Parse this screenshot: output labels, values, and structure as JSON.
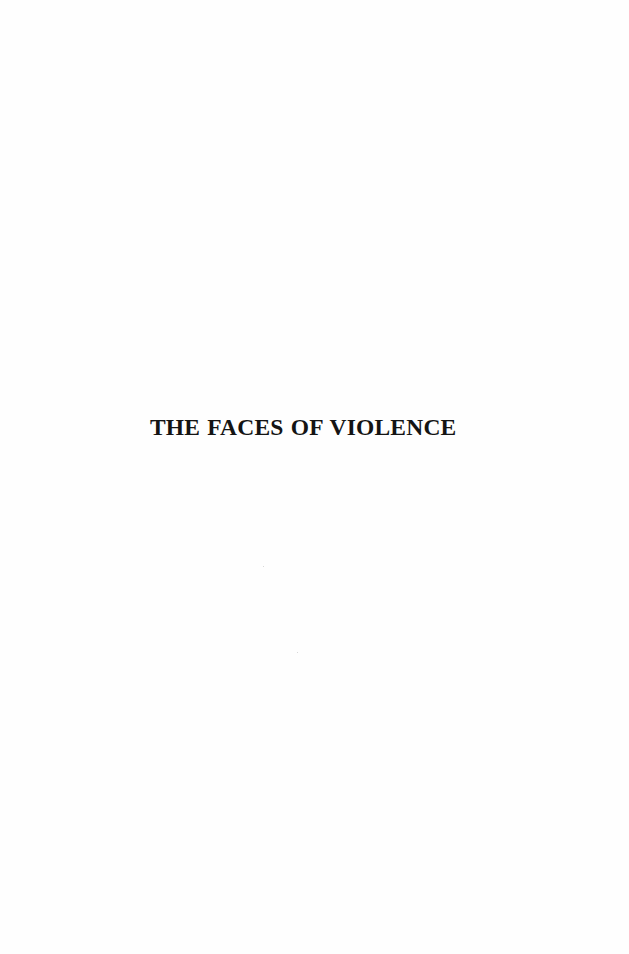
{
  "page": {
    "title": "THE FACES OF VIOLENCE"
  }
}
